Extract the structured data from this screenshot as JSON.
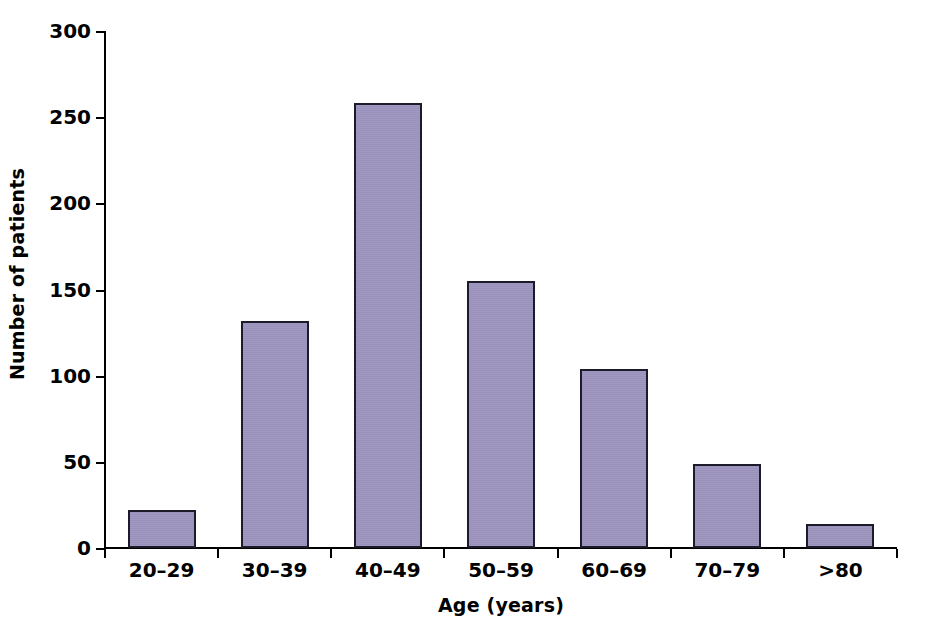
{
  "chart_data": {
    "type": "bar",
    "title": "",
    "xlabel": "Age (years)",
    "ylabel": "Number of patients",
    "categories": [
      "20–29",
      "30–39",
      "40–49",
      "50–59",
      "60–69",
      "70–79",
      ">80"
    ],
    "values": [
      22,
      132,
      258,
      155,
      104,
      49,
      14
    ],
    "ylim": [
      0,
      300
    ],
    "yticks": [
      0,
      50,
      100,
      150,
      200,
      250,
      300
    ],
    "ytick_labels": [
      "0",
      "50",
      "100",
      "150",
      "200",
      "250",
      "300"
    ],
    "grid": false,
    "legend": false,
    "bar_fill_color": "#9c93be",
    "bar_edge_color": "#1b1b2a",
    "axis_color": "#000000",
    "background_color": "#ffffff"
  }
}
